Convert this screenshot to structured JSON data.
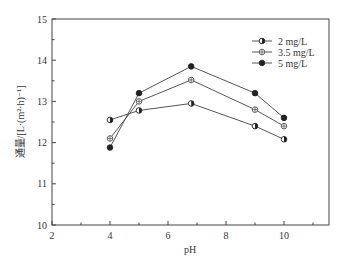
{
  "chart_data": {
    "type": "line",
    "title": "",
    "xlabel": "pH",
    "ylabel": "通量/[L·(m²·h)⁻¹]",
    "xlim": [
      2,
      11.5
    ],
    "ylim": [
      10,
      15
    ],
    "xticks": [
      2,
      4,
      6,
      8,
      10
    ],
    "yticks": [
      10,
      11,
      12,
      13,
      14,
      15
    ],
    "grid": false,
    "legend_position": "upper right",
    "x": [
      4,
      5,
      6.8,
      9,
      10
    ],
    "series": [
      {
        "name": "2 mg/L",
        "marker": "half-filled-circle",
        "values": [
          12.55,
          12.78,
          12.95,
          12.4,
          12.08
        ]
      },
      {
        "name": "3.5 mg/L",
        "marker": "crossed-circle",
        "values": [
          12.1,
          13.0,
          13.52,
          12.8,
          12.4
        ]
      },
      {
        "name": "5 mg/L",
        "marker": "filled-circle",
        "values": [
          11.88,
          13.2,
          13.85,
          13.2,
          12.6
        ]
      }
    ]
  },
  "colors": {
    "line": "#555555",
    "axis": "#444444",
    "marker_fill": "#222222"
  }
}
